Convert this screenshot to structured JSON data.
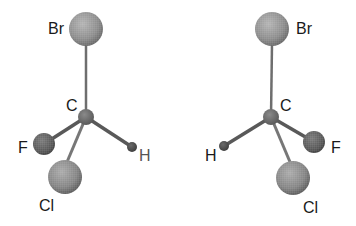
{
  "diagram": {
    "type": "enantiomer-pair",
    "molecules": [
      {
        "id": "left",
        "atoms": {
          "Br": {
            "label": "Br",
            "cx": 86,
            "cy": 29,
            "r": 17,
            "lx": 48,
            "ly": 34
          },
          "C": {
            "label": "C",
            "cx": 86,
            "cy": 117,
            "r": 8,
            "lx": 66,
            "ly": 111
          },
          "F": {
            "label": "F",
            "cx": 44,
            "cy": 144,
            "r": 11,
            "lx": 18,
            "ly": 153
          },
          "Cl": {
            "label": "Cl",
            "cx": 65,
            "cy": 177,
            "r": 17,
            "lx": 39,
            "ly": 211
          },
          "H": {
            "label": "H",
            "cx": 132,
            "cy": 147,
            "r": 5,
            "lx": 139,
            "ly": 161
          }
        }
      },
      {
        "id": "right",
        "atoms": {
          "Br": {
            "label": "Br",
            "cx": 272,
            "cy": 29,
            "r": 17,
            "lx": 296,
            "ly": 34
          },
          "C": {
            "label": "C",
            "cx": 271,
            "cy": 117,
            "r": 8,
            "lx": 280,
            "ly": 111
          },
          "F": {
            "label": "F",
            "cx": 314,
            "cy": 142,
            "r": 11,
            "lx": 331,
            "ly": 153
          },
          "H": {
            "label": "H",
            "cx": 224,
            "cy": 146,
            "r": 5,
            "lx": 205,
            "ly": 161
          },
          "Cl": {
            "label": "Cl",
            "cx": 293,
            "cy": 178,
            "r": 17,
            "lx": 303,
            "ly": 213
          }
        }
      }
    ],
    "colors": {
      "sphere_light": "#b8b8b8",
      "sphere_mid": "#8a8a8a",
      "sphere_dark": "#5a5a5a",
      "bond": "#6e6e6e",
      "label": "#1a1a1a"
    }
  }
}
